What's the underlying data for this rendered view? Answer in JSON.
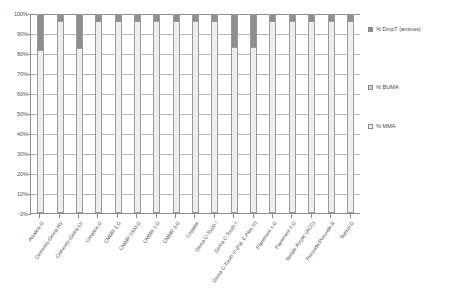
{
  "chart_data": {
    "type": "bar",
    "subtype": "100% stacked column",
    "title": "",
    "xlabel": "",
    "ylabel": "",
    "ylim": [
      0,
      100
    ],
    "ytick_labels": [
      "100%",
      "90%",
      "80%",
      "70%",
      "60%",
      "50%",
      "40%",
      "30%",
      "20%",
      "10%",
      "0%"
    ],
    "ytick_values": [
      100,
      90,
      80,
      70,
      60,
      50,
      40,
      30,
      20,
      10,
      0
    ],
    "grid": true,
    "legend_position": "right",
    "categories": [
      "Alcaline G",
      "Cemento-Gema HV",
      "Cemento-Gema LV",
      "Creatine G",
      "CMMR 1 G",
      "CMMR 2000 G",
      "CMMR 2 G",
      "CMMR 3 G",
      "Copalite",
      "Gema C-Tooth I",
      "Gema C-Tooth II",
      "Gema C-Tooth III (Pal. E Plus III)",
      "Pavement II G",
      "Pavement II G",
      "Simple Acrylic (ACC)",
      "Peroxide/Peroxide R",
      "Sutton G"
    ],
    "series": [
      {
        "name": "% MMA",
        "color": "#eeeeee",
        "values": [
          82,
          97,
          83,
          97,
          97,
          97,
          97,
          97,
          97,
          97,
          84,
          84,
          97,
          97,
          97,
          97,
          97
        ]
      },
      {
        "name": "% BUMA",
        "color": "#d2d2d2",
        "values": [
          0,
          0,
          0,
          0,
          0,
          0,
          0,
          0,
          0,
          0,
          0,
          0,
          0,
          0,
          0,
          0,
          0
        ]
      },
      {
        "name": "% DmpT (amines)",
        "color": "#8e8e8e",
        "values": [
          18,
          3,
          17,
          3,
          3,
          3,
          3,
          3,
          3,
          3,
          16,
          16,
          3,
          3,
          3,
          3,
          3
        ]
      }
    ],
    "legend": [
      {
        "label": "% DmpT (amines)",
        "swatch": "dmpt"
      },
      {
        "label": "% BUMA",
        "swatch": "buma"
      },
      {
        "label": "% MMA",
        "swatch": "mma"
      }
    ]
  }
}
